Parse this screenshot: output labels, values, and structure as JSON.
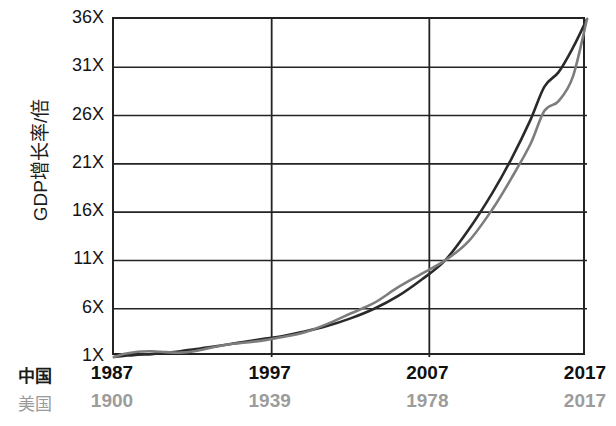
{
  "chart_data": {
    "type": "line",
    "title": "",
    "subtitle": "",
    "ylabel": "GDP增长率/倍",
    "xlabel": "",
    "grid": true,
    "legend_position": "none",
    "ylim": [
      1,
      36
    ],
    "yticks": [
      "36X",
      "31X",
      "26X",
      "21X",
      "16X",
      "11X",
      "6X",
      "1X"
    ],
    "ytick_values": [
      36,
      31,
      26,
      21,
      16,
      11,
      6,
      1
    ],
    "x_axes": [
      {
        "name": "中国",
        "label": "中国",
        "color": "#1b1b1b",
        "ticks": [
          "1987",
          "1997",
          "2007",
          "2017"
        ],
        "tick_values": [
          1987,
          1997,
          2007,
          2017
        ]
      },
      {
        "name": "美国",
        "label": "美国",
        "color": "#9c9c9c",
        "ticks": [
          "1900",
          "1939",
          "1978",
          "2017"
        ],
        "tick_values": [
          1900,
          1939,
          1978,
          2017
        ]
      }
    ],
    "series": [
      {
        "name": "中国",
        "color": "#2a2a2a",
        "x": [
          0,
          0.02,
          0.05,
          0.08,
          0.11,
          0.14,
          0.17,
          0.2,
          0.24,
          0.28,
          0.32,
          0.36,
          0.4,
          0.45,
          0.5,
          0.55,
          0.6,
          0.65,
          0.7,
          0.75,
          0.8,
          0.84,
          0.88,
          0.91,
          0.94,
          0.97,
          1
        ],
        "values": [
          1,
          1.1,
          1.25,
          1.3,
          1.45,
          1.6,
          1.8,
          2.0,
          2.3,
          2.6,
          2.9,
          3.2,
          3.6,
          4.2,
          5.0,
          6.0,
          7.3,
          9.0,
          11,
          14.2,
          18.0,
          21.5,
          25.5,
          29.0,
          30.5,
          33.0,
          36
        ]
      },
      {
        "name": "美国",
        "color": "#7d7d7d",
        "x": [
          0,
          0.02,
          0.05,
          0.08,
          0.11,
          0.14,
          0.17,
          0.2,
          0.24,
          0.28,
          0.32,
          0.36,
          0.4,
          0.45,
          0.5,
          0.55,
          0.6,
          0.65,
          0.7,
          0.75,
          0.8,
          0.84,
          0.88,
          0.91,
          0.94,
          0.97,
          1
        ],
        "values": [
          1,
          1.3,
          1.55,
          1.6,
          1.5,
          1.45,
          1.6,
          1.9,
          2.3,
          2.5,
          2.75,
          3.1,
          3.5,
          4.4,
          5.5,
          6.6,
          8.2,
          9.6,
          11,
          13.0,
          16.3,
          19.5,
          23.0,
          26.5,
          27.5,
          30.0,
          36
        ]
      }
    ]
  }
}
